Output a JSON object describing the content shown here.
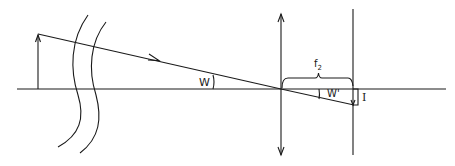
{
  "diagram": {
    "type": "optical ray diagram",
    "labels": {
      "angle_object": "W",
      "angle_image": "W'",
      "focal_length": "f",
      "focal_length_subscript": "2",
      "image_height": "I"
    },
    "colors": {
      "stroke": "#1a1a1a",
      "background": "#ffffff"
    }
  }
}
